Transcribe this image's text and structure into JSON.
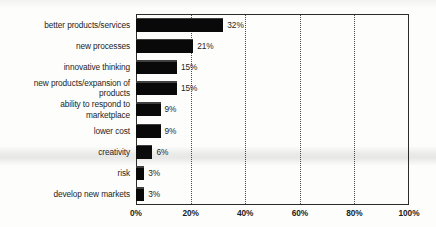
{
  "chart_data": {
    "type": "bar",
    "orientation": "horizontal",
    "title": "",
    "subtitle": "",
    "xlabel": "",
    "ylabel": "",
    "xlim": [
      0,
      100
    ],
    "grid": true,
    "grid_axis": "x",
    "legend": "none",
    "bar_color": "#090909",
    "axis_color": "#2b2b2b",
    "gridline_color": "#4a4a4a",
    "categories": [
      "better products/services",
      "new processes",
      "innovative thinking",
      "new products/expansion of\nproducts",
      "ability to respond to\nmarketplace",
      "lower cost",
      "creativity",
      "risk",
      "develop new markets"
    ],
    "values": [
      32,
      21,
      15,
      15,
      9,
      9,
      6,
      3,
      3
    ],
    "data_labels": [
      "32%",
      "21%",
      "15%",
      "15%",
      "9%",
      "9%",
      "6%",
      "3%",
      "3%"
    ],
    "xticks": [
      0,
      20,
      40,
      60,
      80,
      100
    ],
    "xtick_labels": [
      "0%",
      "20%",
      "40%",
      "60%",
      "80%",
      "100%"
    ]
  }
}
